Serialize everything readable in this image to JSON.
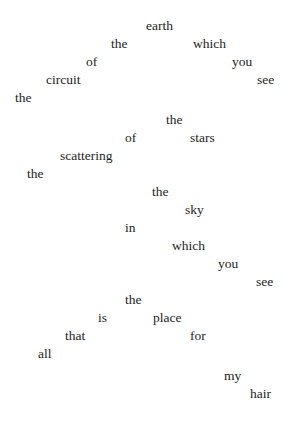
{
  "poem": {
    "words": [
      {
        "text": "earth",
        "x": 146,
        "y": 18
      },
      {
        "text": "the",
        "x": 111,
        "y": 36
      },
      {
        "text": "which",
        "x": 193,
        "y": 36
      },
      {
        "text": "of",
        "x": 86,
        "y": 54
      },
      {
        "text": "you",
        "x": 232,
        "y": 54
      },
      {
        "text": "circuit",
        "x": 46,
        "y": 72
      },
      {
        "text": "see",
        "x": 257,
        "y": 72
      },
      {
        "text": "the",
        "x": 15,
        "y": 90
      },
      {
        "text": "the",
        "x": 166,
        "y": 112
      },
      {
        "text": "of",
        "x": 125,
        "y": 130
      },
      {
        "text": "stars",
        "x": 190,
        "y": 130
      },
      {
        "text": "scattering",
        "x": 60,
        "y": 148
      },
      {
        "text": "the",
        "x": 27,
        "y": 166
      },
      {
        "text": "the",
        "x": 152,
        "y": 184
      },
      {
        "text": "sky",
        "x": 185,
        "y": 202
      },
      {
        "text": "in",
        "x": 125,
        "y": 220
      },
      {
        "text": "which",
        "x": 172,
        "y": 238
      },
      {
        "text": "you",
        "x": 218,
        "y": 256
      },
      {
        "text": "see",
        "x": 256,
        "y": 274
      },
      {
        "text": "the",
        "x": 125,
        "y": 292
      },
      {
        "text": "is",
        "x": 98,
        "y": 310
      },
      {
        "text": "place",
        "x": 153,
        "y": 310
      },
      {
        "text": "that",
        "x": 65,
        "y": 328
      },
      {
        "text": "for",
        "x": 190,
        "y": 328
      },
      {
        "text": "all",
        "x": 38,
        "y": 346
      },
      {
        "text": "my",
        "x": 224,
        "y": 368
      },
      {
        "text": "hair",
        "x": 250,
        "y": 386
      }
    ]
  }
}
